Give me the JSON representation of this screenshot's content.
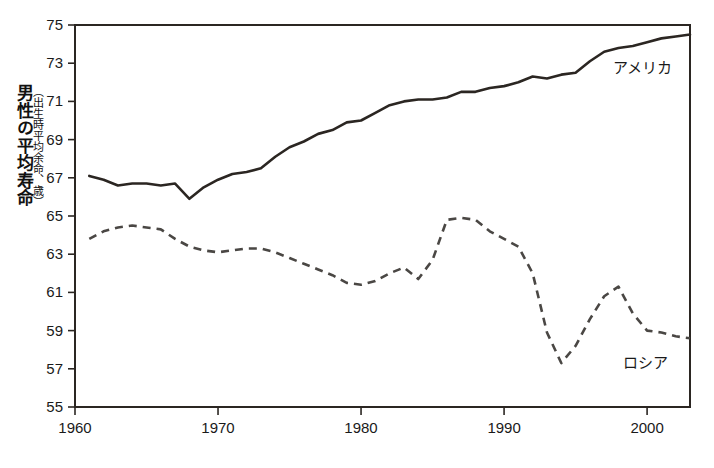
{
  "axis": {
    "y_label_main": "男性の平均寿命",
    "y_label_sub": "（出生時平均余命、歳）",
    "y_ticks": [
      "55",
      "57",
      "59",
      "61",
      "63",
      "65",
      "67",
      "69",
      "71",
      "73",
      "75"
    ],
    "x_ticks": [
      "1960",
      "1970",
      "1980",
      "1990",
      "2000"
    ]
  },
  "labels": {
    "america": "アメリカ",
    "russia": "ロシア"
  },
  "colors": {
    "line_america": "#2b2622",
    "line_russia": "#4a4744",
    "axis": "#2b2622",
    "background": "#ffffff"
  },
  "footer_caption": "",
  "chart_data": {
    "type": "line",
    "title": "",
    "xlabel": "",
    "ylabel": "男性の平均寿命（出生時平均余命、歳）",
    "xlim": [
      1960,
      2003
    ],
    "ylim": [
      55,
      75
    ],
    "yticks": [
      55,
      57,
      59,
      61,
      63,
      65,
      67,
      69,
      71,
      73,
      75
    ],
    "xticks": [
      1960,
      1970,
      1980,
      1990,
      2000
    ],
    "grid": false,
    "legend_position": "inline-annotation",
    "series": [
      {
        "name": "アメリカ",
        "style": "solid",
        "x": [
          1961,
          1962,
          1963,
          1964,
          1965,
          1966,
          1967,
          1968,
          1969,
          1970,
          1971,
          1972,
          1973,
          1974,
          1975,
          1976,
          1977,
          1978,
          1979,
          1980,
          1981,
          1982,
          1983,
          1984,
          1985,
          1986,
          1987,
          1988,
          1989,
          1990,
          1991,
          1992,
          1993,
          1994,
          1995,
          1996,
          1997,
          1998,
          1999,
          2000,
          2001,
          2002,
          2003
        ],
        "values": [
          67.1,
          66.9,
          66.6,
          66.7,
          66.7,
          66.6,
          66.7,
          65.9,
          66.5,
          66.9,
          67.2,
          67.3,
          67.5,
          68.1,
          68.6,
          68.9,
          69.3,
          69.5,
          69.9,
          70.0,
          70.4,
          70.8,
          71.0,
          71.1,
          71.1,
          71.2,
          71.5,
          71.5,
          71.7,
          71.8,
          72.0,
          72.3,
          72.2,
          72.4,
          72.5,
          73.1,
          73.6,
          73.8,
          73.9,
          74.1,
          74.3,
          74.4,
          74.5
        ]
      },
      {
        "name": "ロシア",
        "style": "dashed",
        "x": [
          1961,
          1962,
          1963,
          1964,
          1965,
          1966,
          1967,
          1968,
          1969,
          1970,
          1971,
          1972,
          1973,
          1974,
          1975,
          1976,
          1977,
          1978,
          1979,
          1980,
          1981,
          1982,
          1983,
          1984,
          1985,
          1986,
          1987,
          1988,
          1989,
          1990,
          1991,
          1992,
          1993,
          1994,
          1995,
          1996,
          1997,
          1998,
          1999,
          2000,
          2001,
          2002,
          2003
        ],
        "values": [
          63.8,
          64.2,
          64.4,
          64.5,
          64.4,
          64.3,
          63.8,
          63.4,
          63.2,
          63.1,
          63.2,
          63.3,
          63.3,
          63.1,
          62.8,
          62.5,
          62.2,
          61.9,
          61.5,
          61.4,
          61.6,
          62.0,
          62.3,
          61.7,
          62.7,
          64.8,
          64.9,
          64.8,
          64.2,
          63.8,
          63.4,
          62.0,
          58.9,
          57.3,
          58.2,
          59.6,
          60.8,
          61.3,
          59.9,
          59.0,
          58.9,
          58.7,
          58.6
        ]
      }
    ]
  }
}
